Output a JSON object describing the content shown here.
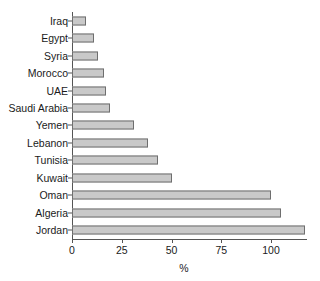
{
  "chart_data": {
    "type": "bar",
    "orientation": "horizontal",
    "title": "",
    "subtitle": "",
    "xlabel": "%",
    "ylabel": "",
    "xlim": [
      0,
      118
    ],
    "xticks": [
      0,
      25,
      50,
      75,
      100
    ],
    "xticklabels": [
      "0",
      "25",
      "50",
      "75",
      "100"
    ],
    "grid": false,
    "legend": null,
    "categories": [
      "Iraq",
      "Egypt",
      "Syria",
      "Morocco",
      "UAE",
      "Saudi Arabia",
      "Yemen",
      "Lebanon",
      "Tunisia",
      "Kuwait",
      "Oman",
      "Algeria",
      "Jordan"
    ],
    "values": [
      7,
      11,
      13,
      16,
      17,
      19,
      31,
      38,
      43,
      50,
      100,
      105,
      117
    ],
    "bar_fill_color": "#c9c9c9",
    "bar_edge_color": "#6e6e6e",
    "axis_color": "#555555",
    "background_color": "#ffffff"
  }
}
